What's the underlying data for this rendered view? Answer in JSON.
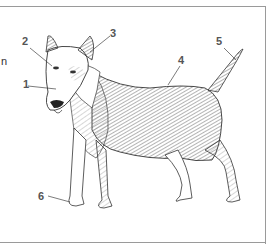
{
  "figure": {
    "side_text_fragment": "n",
    "labels": [
      {
        "id": "1",
        "text": "1",
        "x": 23,
        "y": 79
      },
      {
        "id": "2",
        "text": "2",
        "x": 22,
        "y": 36
      },
      {
        "id": "3",
        "text": "3",
        "x": 110,
        "y": 28
      },
      {
        "id": "4",
        "text": "4",
        "x": 178,
        "y": 55
      },
      {
        "id": "5",
        "text": "5",
        "x": 216,
        "y": 36
      },
      {
        "id": "6",
        "text": "6",
        "x": 38,
        "y": 191
      }
    ],
    "colors": {
      "frame": "#9a9a9a",
      "label": "#555555",
      "ink": "#333333"
    }
  }
}
